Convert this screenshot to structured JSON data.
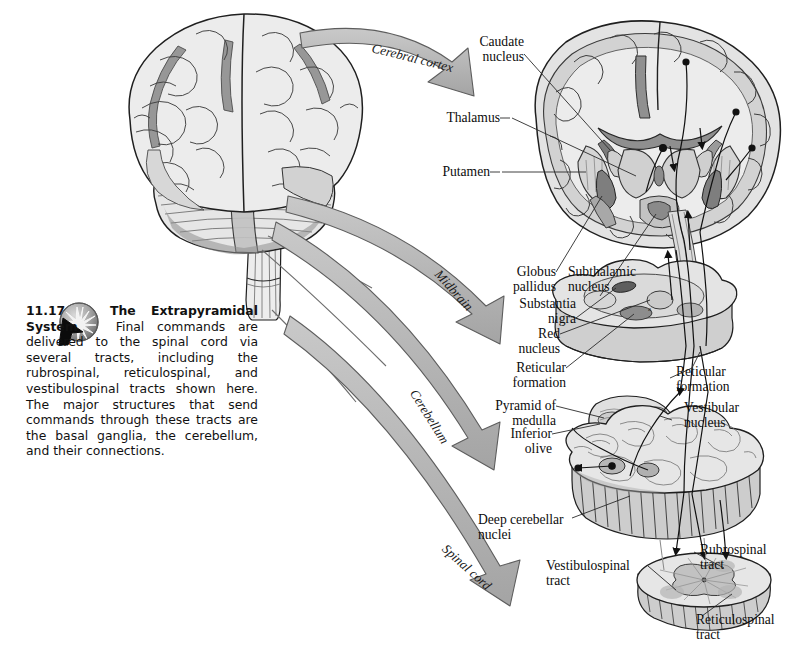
{
  "figure": {
    "number": "11.17",
    "title": "The Extrapyramidal System",
    "body": "Final commands are delivered to the spinal cord via several tracts, including the rubrospinal, reticulospinal, and vestibulospinal tracts shown here. The major structures that send commands through these tracts are the basal ganglia, the cerebellum, and their connections.",
    "icon": "starburst-sphere-icon",
    "cursor_icon": "arrow-cursor-icon"
  },
  "arrows": [
    {
      "label": "Cerebral cortex",
      "target": "coronal-brain-section"
    },
    {
      "label": "Midbrain",
      "target": "midbrain-section"
    },
    {
      "label": "Cerebellum",
      "target": "medulla-cerebellum-section"
    },
    {
      "label": "Spinal cord",
      "target": "spinal-cord-section"
    }
  ],
  "labels": {
    "caudate_nucleus": "Caudate\nnucleus",
    "thalamus": "Thalamus",
    "putamen": "Putamen",
    "globus_pallidus": "Globus\npallidus",
    "subthalamic_nucleus": "Subthalamic\nnucleus",
    "substantia_nigra": "Substantia\nnigra",
    "red_nucleus": "Red\nnucleus",
    "reticular_formation_midbrain": "Reticular\nformation",
    "pyramid_of_medulla": "Pyramid of\nmedulla",
    "inferior_olive": "Inferior\nolive",
    "reticular_formation_medulla": "Reticular\nformation",
    "vestibular_nucleus": "Vestibular\nnucleus",
    "deep_cerebellar_nuclei": "Deep cerebellar\nnuclei",
    "vestibulospinal_tract": "Vestibulospinal\ntract",
    "rubrospinal_tract": "Rubrospinal\ntract",
    "reticulospinal_tract": "Reticulospinal\ntract"
  },
  "colors": {
    "outline": "#1a1a1a",
    "tissue_light": "#e2e2e2",
    "tissue_mid": "#c9c9c9",
    "tissue_dark": "#9a9a9a",
    "tissue_darkest": "#6f6f6f",
    "arrow_fill": "#b6b6b6",
    "arrow_stroke": "#5d5d5d",
    "background": "#ffffff",
    "text": "#0d0d0d"
  }
}
